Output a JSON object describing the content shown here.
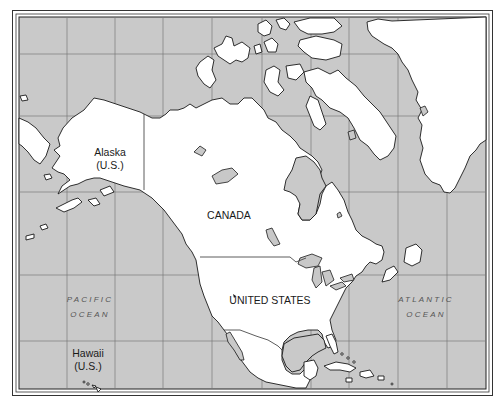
{
  "map": {
    "title": "",
    "colors": {
      "ocean": "#c9c9c9",
      "land": "#ffffff",
      "coastline": "#1a1a1a",
      "gridline": "#7a7a7a",
      "frame": "#333333"
    },
    "labels": {
      "alaska": {
        "name": "Alaska",
        "note": "(U.S.)"
      },
      "canada": {
        "name": "CANADA"
      },
      "united_states": {
        "name": "UNITED STATES"
      },
      "hawaii": {
        "name": "Hawaii",
        "note": "(U.S.)"
      },
      "pacific": {
        "line1": "PACIFIC",
        "line2": "OCEAN"
      },
      "atlantic": {
        "line1": "ATLANTIC",
        "line2": "OCEAN"
      }
    },
    "regions": [
      "Alaska",
      "Canada",
      "Greenland",
      "United States",
      "Mexico",
      "Central America",
      "Caribbean islands",
      "Hawaii"
    ],
    "gridlines": {
      "vertical_x": [
        67,
        115,
        163,
        262,
        349,
        398
      ],
      "horizontal_y": [
        54,
        116,
        275,
        341
      ]
    }
  }
}
